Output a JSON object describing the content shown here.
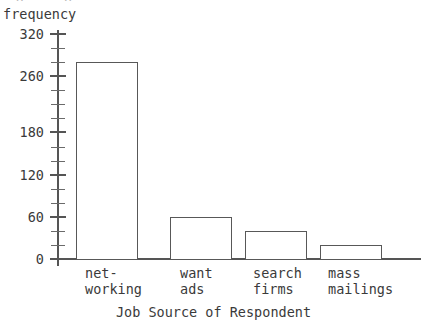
{
  "chart_data": {
    "type": "bar",
    "title": "",
    "xlabel": "Job Source of Respondent",
    "ylabel": "frequency",
    "categories": [
      "net-\nworking",
      "want\nads",
      "search\nfirms",
      "mass\nmailings"
    ],
    "category_lines": [
      [
        "net-",
        "working"
      ],
      [
        "want",
        "ads"
      ],
      [
        "search",
        "firms"
      ],
      [
        "mass",
        "mailings"
      ]
    ],
    "values": [
      280,
      60,
      40,
      20
    ],
    "ylim": [
      0,
      320
    ],
    "ytick_labels": [
      "320",
      "260",
      "180",
      "120",
      "60",
      "0"
    ],
    "ytick_values": [
      320,
      260,
      180,
      120,
      60,
      0
    ],
    "minor_tick_interval": 20,
    "minor_tick_values": [
      20,
      40,
      80,
      100,
      140,
      160,
      200,
      220,
      240,
      280,
      300
    ],
    "grid": false,
    "legend": false,
    "bar_fill": "#ffffff",
    "bar_border_color": "#585858",
    "axis_color": "#555555",
    "text_color": "#3a3a3a",
    "background": "#ffffff"
  },
  "artifacts": {
    "top_clipped_text": "· g · · g · ·"
  }
}
